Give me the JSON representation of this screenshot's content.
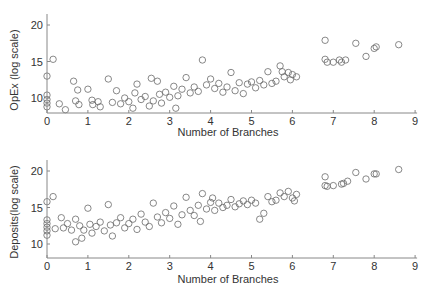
{
  "chart_data": [
    {
      "type": "scatter",
      "title": "",
      "xlabel": "Number of Branches",
      "ylabel": "OpEx (log scale)",
      "xlim": [
        0,
        9
      ],
      "ylim": [
        8,
        22
      ],
      "xticks": [
        "0",
        "1",
        "2",
        "3",
        "4",
        "5",
        "6",
        "7",
        "8",
        "9"
      ],
      "yticks": [
        "10",
        "15",
        "20"
      ],
      "grid": false,
      "marker": "open-circle",
      "points": [
        [
          0,
          13
        ],
        [
          0,
          10.4
        ],
        [
          0,
          9.8
        ],
        [
          0,
          9.3
        ],
        [
          0,
          8.8
        ],
        [
          0.15,
          15.3
        ],
        [
          0.3,
          9.2
        ],
        [
          0.45,
          8.4
        ],
        [
          0.65,
          12.3
        ],
        [
          0.7,
          9.6
        ],
        [
          0.75,
          11.1
        ],
        [
          0.78,
          9.1
        ],
        [
          1.0,
          11.2
        ],
        [
          1.1,
          9.7
        ],
        [
          1.12,
          9.1
        ],
        [
          1.25,
          9.5
        ],
        [
          1.3,
          8.8
        ],
        [
          1.5,
          12.6
        ],
        [
          1.6,
          9.4
        ],
        [
          1.7,
          11.0
        ],
        [
          1.8,
          9.2
        ],
        [
          1.9,
          10.0
        ],
        [
          2.0,
          9.5
        ],
        [
          2.1,
          8.6
        ],
        [
          2.15,
          10.7
        ],
        [
          2.2,
          11.9
        ],
        [
          2.3,
          9.8
        ],
        [
          2.4,
          10.2
        ],
        [
          2.5,
          8.9
        ],
        [
          2.55,
          12.7
        ],
        [
          2.6,
          9.6
        ],
        [
          2.7,
          12.3
        ],
        [
          2.75,
          10.5
        ],
        [
          2.8,
          9.3
        ],
        [
          2.9,
          10.8
        ],
        [
          3.0,
          10.1
        ],
        [
          3.1,
          11.6
        ],
        [
          3.15,
          8.6
        ],
        [
          3.2,
          10.3
        ],
        [
          3.3,
          11.2
        ],
        [
          3.4,
          12.8
        ],
        [
          3.5,
          10.7
        ],
        [
          3.6,
          11.5
        ],
        [
          3.7,
          10.9
        ],
        [
          3.8,
          15.2
        ],
        [
          3.9,
          11.8
        ],
        [
          4.0,
          12.6
        ],
        [
          4.1,
          11.3
        ],
        [
          4.2,
          12.0
        ],
        [
          4.3,
          10.8
        ],
        [
          4.4,
          11.5
        ],
        [
          4.5,
          13.5
        ],
        [
          4.6,
          11.0
        ],
        [
          4.7,
          12.1
        ],
        [
          4.8,
          10.6
        ],
        [
          4.9,
          11.9
        ],
        [
          5.0,
          12.2
        ],
        [
          5.1,
          11.4
        ],
        [
          5.2,
          12.4
        ],
        [
          5.3,
          11.8
        ],
        [
          5.4,
          13.6
        ],
        [
          5.5,
          12.0
        ],
        [
          5.6,
          12.3
        ],
        [
          5.7,
          14.4
        ],
        [
          5.75,
          13.6
        ],
        [
          5.8,
          12.9
        ],
        [
          5.9,
          13.5
        ],
        [
          5.95,
          12.5
        ],
        [
          6.0,
          13.2
        ],
        [
          6.1,
          12.9
        ],
        [
          6.8,
          17.9
        ],
        [
          6.8,
          15.3
        ],
        [
          6.85,
          14.9
        ],
        [
          7.0,
          14.9
        ],
        [
          7.15,
          15.2
        ],
        [
          7.2,
          14.9
        ],
        [
          7.3,
          15.2
        ],
        [
          7.55,
          17.5
        ],
        [
          7.8,
          15.7
        ],
        [
          8.0,
          16.8
        ],
        [
          8.05,
          17.0
        ],
        [
          8.6,
          17.3
        ]
      ]
    },
    {
      "type": "scatter",
      "title": "",
      "xlabel": "Number of Branches",
      "ylabel": "Deposits(log scale)",
      "xlim": [
        0,
        9
      ],
      "ylim": [
        8,
        22
      ],
      "xticks": [
        "0",
        "1",
        "2",
        "3",
        "4",
        "5",
        "6",
        "7",
        "8",
        "9"
      ],
      "yticks": [
        "10",
        "15",
        "20"
      ],
      "grid": false,
      "marker": "open-circle",
      "points": [
        [
          0,
          15.8
        ],
        [
          0,
          13.3
        ],
        [
          0,
          12.8
        ],
        [
          0,
          12.3
        ],
        [
          0,
          11.8
        ],
        [
          0,
          11.2
        ],
        [
          0.15,
          16.5
        ],
        [
          0.2,
          12.1
        ],
        [
          0.35,
          13.6
        ],
        [
          0.4,
          12.2
        ],
        [
          0.5,
          12.8
        ],
        [
          0.6,
          11.9
        ],
        [
          0.7,
          10.3
        ],
        [
          0.7,
          13.4
        ],
        [
          0.8,
          12.5
        ],
        [
          0.85,
          10.8
        ],
        [
          0.9,
          11.9
        ],
        [
          1.0,
          14.9
        ],
        [
          1.05,
          12.7
        ],
        [
          1.1,
          11.5
        ],
        [
          1.2,
          12.4
        ],
        [
          1.3,
          13.0
        ],
        [
          1.4,
          11.8
        ],
        [
          1.5,
          15.4
        ],
        [
          1.55,
          12.6
        ],
        [
          1.6,
          11.1
        ],
        [
          1.7,
          12.9
        ],
        [
          1.8,
          13.6
        ],
        [
          1.9,
          12.2
        ],
        [
          2.0,
          12.8
        ],
        [
          2.1,
          13.4
        ],
        [
          2.2,
          12.0
        ],
        [
          2.3,
          14.1
        ],
        [
          2.4,
          13.0
        ],
        [
          2.5,
          12.4
        ],
        [
          2.6,
          15.6
        ],
        [
          2.7,
          13.7
        ],
        [
          2.8,
          12.9
        ],
        [
          2.9,
          14.3
        ],
        [
          3.0,
          13.5
        ],
        [
          3.1,
          15.2
        ],
        [
          3.2,
          12.7
        ],
        [
          3.3,
          14.0
        ],
        [
          3.4,
          16.4
        ],
        [
          3.5,
          14.6
        ],
        [
          3.6,
          13.9
        ],
        [
          3.7,
          15.3
        ],
        [
          3.75,
          13.1
        ],
        [
          3.8,
          16.9
        ],
        [
          3.9,
          14.8
        ],
        [
          4.0,
          15.7
        ],
        [
          4.05,
          16.3
        ],
        [
          4.1,
          14.6
        ],
        [
          4.2,
          15.6
        ],
        [
          4.3,
          15.0
        ],
        [
          4.4,
          15.3
        ],
        [
          4.5,
          16.1
        ],
        [
          4.6,
          15.1
        ],
        [
          4.7,
          15.5
        ],
        [
          4.8,
          15.9
        ],
        [
          4.9,
          15.4
        ],
        [
          5.0,
          16.0
        ],
        [
          5.1,
          15.6
        ],
        [
          5.2,
          13.4
        ],
        [
          5.3,
          14.2
        ],
        [
          5.4,
          16.5
        ],
        [
          5.5,
          15.8
        ],
        [
          5.6,
          16.0
        ],
        [
          5.7,
          17.0
        ],
        [
          5.8,
          16.5
        ],
        [
          5.9,
          17.2
        ],
        [
          6.0,
          16.3
        ],
        [
          6.05,
          15.9
        ],
        [
          6.1,
          16.8
        ],
        [
          6.8,
          19.2
        ],
        [
          6.8,
          18.0
        ],
        [
          6.85,
          17.9
        ],
        [
          7.0,
          18.0
        ],
        [
          7.2,
          18.2
        ],
        [
          7.25,
          18.3
        ],
        [
          7.35,
          18.6
        ],
        [
          7.55,
          19.8
        ],
        [
          7.8,
          18.9
        ],
        [
          8.0,
          19.6
        ],
        [
          8.05,
          19.6
        ],
        [
          8.6,
          20.2
        ]
      ]
    }
  ],
  "plots": {
    "top": {
      "ylabel": "OpEx (log scale)",
      "xlabel": "Number of Branches"
    },
    "bottom": {
      "ylabel": "Deposits(log scale)",
      "xlabel": "Number of Branches"
    }
  }
}
